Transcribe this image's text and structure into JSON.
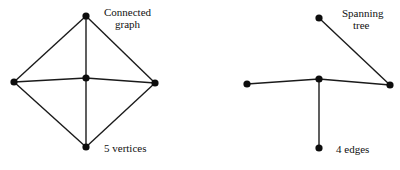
{
  "graphs": {
    "connected": {
      "label_line1": "Connected",
      "label_line2": "graph",
      "caption": "5 vertices",
      "vertices": [
        {
          "id": "top",
          "x": 86,
          "y": 16
        },
        {
          "id": "left",
          "x": 14,
          "y": 82
        },
        {
          "id": "center",
          "x": 86,
          "y": 78
        },
        {
          "id": "right",
          "x": 155,
          "y": 83
        },
        {
          "id": "bottom",
          "x": 86,
          "y": 147
        }
      ],
      "edges": [
        [
          "top",
          "left"
        ],
        [
          "top",
          "right"
        ],
        [
          "top",
          "center"
        ],
        [
          "left",
          "center"
        ],
        [
          "center",
          "right"
        ],
        [
          "center",
          "bottom"
        ],
        [
          "left",
          "bottom"
        ],
        [
          "right",
          "bottom"
        ]
      ]
    },
    "spanning": {
      "label_line1": "Spanning",
      "label_line2": "tree",
      "caption": "4 edges",
      "vertices": [
        {
          "id": "top",
          "x": 319,
          "y": 18
        },
        {
          "id": "left",
          "x": 247,
          "y": 84
        },
        {
          "id": "center",
          "x": 319,
          "y": 79
        },
        {
          "id": "right",
          "x": 390,
          "y": 85
        },
        {
          "id": "bottom",
          "x": 319,
          "y": 148
        }
      ],
      "edges": [
        [
          "top",
          "right"
        ],
        [
          "left",
          "center"
        ],
        [
          "center",
          "right"
        ],
        [
          "center",
          "bottom"
        ]
      ]
    }
  }
}
